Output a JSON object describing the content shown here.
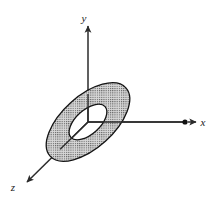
{
  "figure": {
    "background_color": "#ffffff",
    "width": 219,
    "height": 204
  },
  "axes": {
    "x": {
      "label": "x",
      "label_x": 203,
      "label_y": 126,
      "line": {
        "x1": 88,
        "y1": 122,
        "x2": 185,
        "y2": 122
      },
      "arrow_tip_x": 196,
      "arrow_tip_y": 122,
      "point_marker": {
        "cx": 185,
        "cy": 122,
        "r": 2.6
      },
      "color": "#2b2b2b"
    },
    "y": {
      "label": "y",
      "label_x": 84,
      "label_y": 22,
      "line": {
        "x1": 88,
        "y1": 122,
        "x2": 88,
        "y2": 34
      },
      "arrow_tip_x": 88,
      "arrow_tip_y": 26,
      "color": "#2b2b2b"
    },
    "z": {
      "label": "z",
      "label_x": 13,
      "label_y": 191,
      "line": {
        "x1": 88,
        "y1": 122,
        "x2": 33,
        "y2": 176
      },
      "arrow_tip_x": 27,
      "arrow_tip_y": 182,
      "color": "#2b2b2b"
    }
  },
  "annulus": {
    "name": "annulus-region",
    "center_x": 88,
    "center_y": 122,
    "outer_rx": 51,
    "outer_ry": 26,
    "inner_rx": 23,
    "inner_ry": 12,
    "rotation_deg": -42,
    "fill_color": "#c9c9c9",
    "stroke_color": "#1a1a1a",
    "stipple": "dotted-grid"
  },
  "origin": {
    "x": 88,
    "y": 122
  }
}
